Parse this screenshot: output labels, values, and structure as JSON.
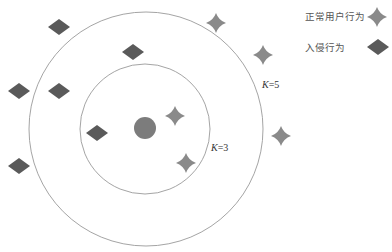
{
  "diagram": {
    "title": "",
    "colors": {
      "background": "#ffffff",
      "circle_stroke": "#9a9a9a",
      "normal_marker": "#8a8a8a",
      "intrusion_marker": "#5a5a5a",
      "query_point": "#7c7c7c"
    },
    "circles": [
      {
        "name": "K=3",
        "cx": 145,
        "cy": 129,
        "r": 65,
        "label": "K=3",
        "label_var": "K",
        "label_val": "=3",
        "label_x": 211,
        "label_y": 142
      },
      {
        "name": "K=5",
        "cx": 146,
        "cy": 129,
        "r": 117,
        "label": "K=5",
        "label_var": "K",
        "label_val": "=5",
        "label_x": 262,
        "label_y": 79
      }
    ],
    "query_point": {
      "cx": 145,
      "cy": 128,
      "r": 11
    },
    "normal_points": [
      {
        "x": 175,
        "y": 116
      },
      {
        "x": 186,
        "y": 163
      },
      {
        "x": 216,
        "y": 23
      },
      {
        "x": 263,
        "y": 55
      },
      {
        "x": 281,
        "y": 136
      }
    ],
    "intrusion_points": [
      {
        "x": 59,
        "y": 27
      },
      {
        "x": 133,
        "y": 52
      },
      {
        "x": 19,
        "y": 91
      },
      {
        "x": 59,
        "y": 91
      },
      {
        "x": 97,
        "y": 133
      },
      {
        "x": 19,
        "y": 166
      }
    ]
  },
  "legend": {
    "items": [
      {
        "label": "正常用户行为",
        "marker": "star-icon",
        "label_x": 305,
        "label_y": 11,
        "marker_x": 377,
        "marker_y": 17
      },
      {
        "label": "入侵行为",
        "marker": "diamond-icon",
        "label_x": 305,
        "label_y": 42,
        "marker_x": 378,
        "marker_y": 47
      }
    ]
  }
}
